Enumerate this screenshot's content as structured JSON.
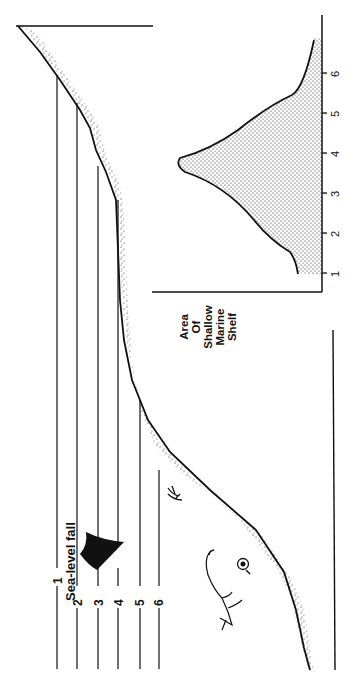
{
  "diagram": {
    "orientation": "rotated 90 degrees counter-clockwise",
    "title": "Sea-level fall",
    "arrow_icon": "arrow-down-icon",
    "sea_levels": [
      {
        "label": "1"
      },
      {
        "label": "2"
      },
      {
        "label": "3"
      },
      {
        "label": "4"
      },
      {
        "label": "5"
      },
      {
        "label": "6"
      }
    ],
    "inset": {
      "caption_lines": [
        "Area",
        "Of",
        "Shallow",
        "Marine",
        "Shelf"
      ],
      "axis_ticks": [
        "1",
        "2",
        "3",
        "4",
        "5",
        "6"
      ]
    },
    "illustrations": [
      "plesiosaur",
      "ammonite",
      "crinoid"
    ],
    "colors": {
      "ink": "#111111",
      "background": "#ffffff"
    }
  }
}
